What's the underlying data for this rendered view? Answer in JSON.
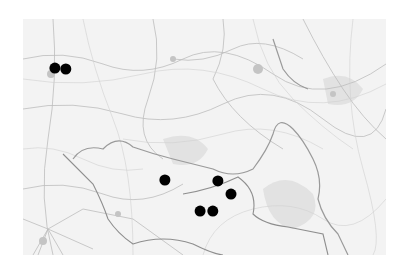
{
  "map": {
    "style": "grayscale historical topographic map",
    "background_color": "#f3f3f3",
    "line_color": "#bdbdbd",
    "marker_color": "#000000",
    "markers": [
      {
        "id": 1,
        "x_frac": 0.088,
        "y_frac": 0.208
      },
      {
        "id": 2,
        "x_frac": 0.118,
        "y_frac": 0.212
      },
      {
        "id": 3,
        "x_frac": 0.391,
        "y_frac": 0.682
      },
      {
        "id": 4,
        "x_frac": 0.537,
        "y_frac": 0.686
      },
      {
        "id": 5,
        "x_frac": 0.573,
        "y_frac": 0.742
      },
      {
        "id": 6,
        "x_frac": 0.488,
        "y_frac": 0.814
      },
      {
        "id": 7,
        "x_frac": 0.523,
        "y_frac": 0.814
      }
    ]
  }
}
